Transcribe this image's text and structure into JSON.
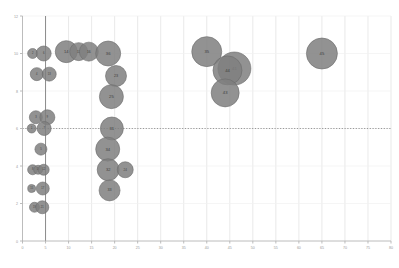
{
  "chart_data": {
    "type": "scatter",
    "subtype": "bubble",
    "title": "",
    "xlabel": "",
    "ylabel": "",
    "xlim": [
      0,
      80
    ],
    "ylim": [
      0,
      12
    ],
    "xticks": [
      0,
      5,
      10,
      15,
      20,
      25,
      30,
      35,
      40,
      45,
      50,
      55,
      60,
      65,
      70,
      75,
      80
    ],
    "yticks": [
      0,
      2,
      4,
      6,
      8,
      10,
      12
    ],
    "xtick_labels": [
      "0",
      "5",
      "10",
      "15",
      "20",
      "25",
      "30",
      "35",
      "40",
      "45",
      "50",
      "55",
      "60",
      "65",
      "70",
      "75",
      "80"
    ],
    "ytick_labels": [
      "0",
      "2",
      "4",
      "6",
      "8",
      "10",
      "12"
    ],
    "grid": "vertical-light",
    "legend": "none",
    "reference_lines": [
      {
        "name": "vertical-reference",
        "orientation": "vertical",
        "value": 5,
        "style": "solid",
        "color": "#8c8c8c"
      },
      {
        "name": "horizontal-reference",
        "orientation": "horizontal",
        "value": 6,
        "style": "dotted",
        "color": "#8c8c8c"
      }
    ],
    "bubble_style": {
      "fill": "#7f7f7f",
      "stroke": "#6b6b6b",
      "opacity": 0.85,
      "label_color": "#3d3d3d"
    },
    "points": [
      {
        "label": "2",
        "x": 2.2,
        "y": 10.0,
        "size": 5.0
      },
      {
        "label": "6",
        "x": 4.6,
        "y": 10.0,
        "size": 7.5
      },
      {
        "label": "14",
        "x": 9.5,
        "y": 10.1,
        "size": 11.0
      },
      {
        "label": "11",
        "x": 12.2,
        "y": 10.1,
        "size": 9.0
      },
      {
        "label": "16",
        "x": 14.4,
        "y": 10.1,
        "size": 9.5
      },
      {
        "label": "36",
        "x": 18.6,
        "y": 10.0,
        "size": 12.5
      },
      {
        "label": "4",
        "x": 3.1,
        "y": 8.9,
        "size": 6.5
      },
      {
        "label": "13",
        "x": 5.8,
        "y": 8.9,
        "size": 7.0
      },
      {
        "label": "23",
        "x": 20.3,
        "y": 8.8,
        "size": 10.5
      },
      {
        "label": "25",
        "x": 19.3,
        "y": 7.7,
        "size": 12.0
      },
      {
        "label": "3",
        "x": 2.9,
        "y": 6.6,
        "size": 6.5
      },
      {
        "label": "9",
        "x": 5.4,
        "y": 6.6,
        "size": 7.5
      },
      {
        "label": "1",
        "x": 2.0,
        "y": 6.0,
        "size": 4.5
      },
      {
        "label": "7",
        "x": 4.7,
        "y": 6.0,
        "size": 7.0
      },
      {
        "label": "31",
        "x": 19.4,
        "y": 6.0,
        "size": 11.5
      },
      {
        "label": "5",
        "x": 4.0,
        "y": 4.9,
        "size": 6.0
      },
      {
        "label": "34",
        "x": 18.5,
        "y": 4.9,
        "size": 12.0
      },
      {
        "label": "8",
        "x": 2.2,
        "y": 3.8,
        "size": 5.0
      },
      {
        "label": "10",
        "x": 3.4,
        "y": 3.8,
        "size": 4.5
      },
      {
        "label": "12",
        "x": 4.6,
        "y": 3.8,
        "size": 5.5
      },
      {
        "label": "32",
        "x": 18.6,
        "y": 3.8,
        "size": 11.0
      },
      {
        "label": "24",
        "x": 22.3,
        "y": 3.8,
        "size": 8.0
      },
      {
        "label": "15",
        "x": 2.0,
        "y": 2.8,
        "size": 4.0
      },
      {
        "label": "17",
        "x": 4.4,
        "y": 2.8,
        "size": 6.5
      },
      {
        "label": "33",
        "x": 18.9,
        "y": 2.7,
        "size": 10.5
      },
      {
        "label": "19",
        "x": 2.6,
        "y": 1.8,
        "size": 5.0
      },
      {
        "label": "21",
        "x": 4.3,
        "y": 1.8,
        "size": 6.5
      },
      {
        "label": "35",
        "x": 40.0,
        "y": 10.1,
        "size": 15.0
      },
      {
        "label": "41",
        "x": 46.0,
        "y": 9.2,
        "size": 16.5
      },
      {
        "label": "44",
        "x": 44.5,
        "y": 9.1,
        "size": 14.5
      },
      {
        "label": "43",
        "x": 44.0,
        "y": 7.9,
        "size": 14.0
      },
      {
        "label": "45",
        "x": 65.0,
        "y": 10.0,
        "size": 15.5
      }
    ]
  }
}
